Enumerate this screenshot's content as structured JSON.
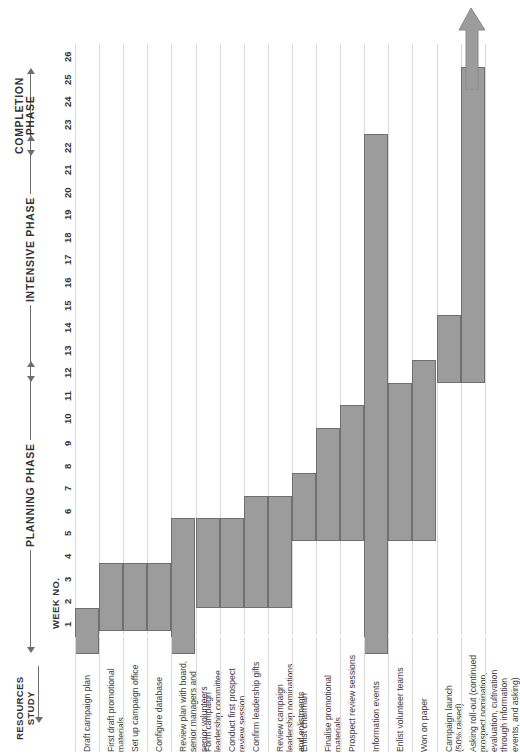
{
  "chart_data": {
    "type": "bar",
    "orientation": "horizontal-gantt-rotated",
    "title": "",
    "xlabel": "WEEK NO.",
    "ylabel": "RESOURCES STUDY",
    "xlim": [
      1,
      26
    ],
    "grid": true,
    "bar_color": "#9c9c9c",
    "bar_border_color": "#6f6f6f",
    "week_axis": {
      "label": "WEEK NO.",
      "ticks": [
        1,
        2,
        3,
        4,
        5,
        6,
        7,
        8,
        9,
        10,
        11,
        12,
        13,
        14,
        15,
        16,
        17,
        18,
        19,
        20,
        21,
        22,
        23,
        24,
        25,
        26
      ]
    },
    "phases": [
      {
        "name": "PLANNING PHASE",
        "start_week": 1,
        "end_week": 13
      },
      {
        "name": "INTENSIVE PHASE",
        "start_week": 13,
        "end_week": 23
      },
      {
        "name": "COMPLETION PHASE",
        "start_week": 23,
        "end_week": 26
      }
    ],
    "categories": [
      "Draft campaign plan",
      "First draft promotional materials",
      "Set up campaign office",
      "Configure database",
      "Review plan with board, senior managers and senior volunteers",
      "Form campaign leadership committee",
      "Conduct first prospect review session",
      "Confirm leadership gifts",
      "Review campaign leadership nominations and enlistments",
      "Enlist chairman",
      "Finalise promotional materials",
      "Prospect review sessions",
      "Information events",
      "Enlist volunteer teams",
      "Won on paper",
      "Campaign launch (50% raised)",
      "Asking roll-out (continued prospect nomination, evaluation, cultivation through information events, and asking)"
    ],
    "tasks": [
      {
        "label": "Draft campaign plan",
        "label_lines": [
          "Draft campaign plan"
        ],
        "start_week": 1,
        "end_week": 2
      },
      {
        "label": "First draft promotional materials",
        "label_lines": [
          "First draft promotional",
          "materials"
        ],
        "start_week": 2,
        "end_week": 4
      },
      {
        "label": "Set up campaign office",
        "label_lines": [
          "Set up campaign office"
        ],
        "start_week": 2,
        "end_week": 4
      },
      {
        "label": "Configure database",
        "label_lines": [
          "Configure database"
        ],
        "start_week": 2,
        "end_week": 4
      },
      {
        "label": "Review plan with board, senior managers and senior volunteers",
        "label_lines": [
          "Review plan with board,",
          "senior managers and",
          "senior volunteers"
        ],
        "start_week": 1,
        "end_week": 6
      },
      {
        "label": "Form campaign leadership committee",
        "label_lines": [
          "Form campaign",
          "leadership committee"
        ],
        "start_week": 3,
        "end_week": 6
      },
      {
        "label": "Conduct first prospect review session",
        "label_lines": [
          "Conduct first prospect",
          "review session"
        ],
        "start_week": 3,
        "end_week": 6
      },
      {
        "label": "Confirm leadership gifts",
        "label_lines": [
          "Confirm leadership gifts"
        ],
        "start_week": 3,
        "end_week": 7
      },
      {
        "label": "Review campaign leadership nominations and enlistments",
        "label_lines": [
          "Review campaign",
          "leadership nominations",
          "and enlistments"
        ],
        "start_week": 3,
        "end_week": 7
      },
      {
        "label": "Enlist chairman",
        "label_lines": [
          "Enlist chairman"
        ],
        "start_week": 6,
        "end_week": 8
      },
      {
        "label": "Finalise promotional materials",
        "label_lines": [
          "Finalise promotional",
          "materials"
        ],
        "start_week": 6,
        "end_week": 10
      },
      {
        "label": "Prospect review sessions",
        "label_lines": [
          "Prospect review sessions"
        ],
        "start_week": 6,
        "end_week": 11
      },
      {
        "label": "Information events",
        "label_lines": [
          "Information events"
        ],
        "start_week": 1,
        "end_week": 23
      },
      {
        "label": "Enlist volunteer teams",
        "label_lines": [
          "Enlist volunteer teams"
        ],
        "start_week": 6,
        "end_week": 12
      },
      {
        "label": "Won on paper",
        "label_lines": [
          "Won on paper"
        ],
        "start_week": 6,
        "end_week": 13
      },
      {
        "label": "Campaign launch (50% raised)",
        "label_lines": [
          "Campaign launch",
          "(50% raised)"
        ],
        "start_week": 13,
        "end_week": 15
      },
      {
        "label": "Asking roll-out (continued prospect nomination, evaluation, cultivation through information events, and asking)",
        "label_lines": [
          "Asking roll-out (continued",
          "prospect nomination,",
          "evaluation, cultivation",
          "through information",
          "events, and asking)"
        ],
        "start_week": 13,
        "end_week": 26
      }
    ]
  },
  "axis": {
    "week_title": "WEEK NO.",
    "resources_study": "RESOURCES\nSTUDY",
    "resources_study_line1": "RESOURCES",
    "resources_study_line2": "STUDY"
  },
  "icons": {
    "big_arrow": "up-arrow-icon",
    "phase_arrow": "arrow-icon",
    "flow_arrow": "down-arrow-icon"
  }
}
